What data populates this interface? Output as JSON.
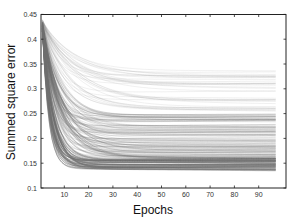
{
  "chart_data": {
    "type": "line",
    "title": "",
    "xlabel": "Epochs",
    "ylabel": "Summed square error",
    "xlim": [
      0,
      101
    ],
    "ylim": [
      0.1,
      0.45
    ],
    "xticks": [
      10,
      20,
      30,
      40,
      50,
      60,
      70,
      80,
      90
    ],
    "xtick_labels": [
      "10",
      "20",
      "30",
      "40",
      "50",
      "60",
      "70",
      "80",
      "90"
    ],
    "yticks": [
      0.1,
      0.15,
      0.2,
      0.25,
      0.3,
      0.35,
      0.4,
      0.45
    ],
    "ytick_labels": [
      "0.1",
      "0.15",
      "0.2",
      "0.25",
      "0.3",
      "0.35",
      "0.4",
      "0.45"
    ],
    "grid": false,
    "legend": null,
    "x_range_of_series": [
      1,
      97
    ],
    "line_color": "#6e6e6e",
    "series_groups": [
      {
        "name": "dense lower band",
        "count": 60,
        "start": 0.43,
        "final_range": [
          0.138,
          0.158
        ],
        "tau_range": [
          2.5,
          5.0
        ],
        "opacity": 0.55
      },
      {
        "name": "middle band",
        "count": 110,
        "start": 0.435,
        "final_range": [
          0.16,
          0.25
        ],
        "tau_range": [
          3.5,
          9.0
        ],
        "opacity": 0.28
      },
      {
        "name": "upper sparse band",
        "count": 35,
        "start": 0.44,
        "final_range": [
          0.25,
          0.34
        ],
        "tau_range": [
          6.0,
          16.0
        ],
        "opacity": 0.18
      }
    ]
  }
}
